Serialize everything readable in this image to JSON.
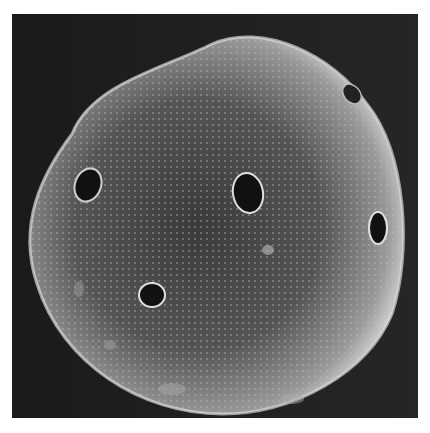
{
  "image": {
    "subject": "scanning electron micrograph of a spherical pollen grain with multiple circular pores",
    "background_color": "#1c1c1c",
    "border_color": "#ffffff",
    "grain_fill": "#8a8a8a",
    "pore_color": "#111111"
  },
  "pores": [
    {
      "cx": 76,
      "cy": 171,
      "rx": 13,
      "ry": 17,
      "rot": 20
    },
    {
      "cx": 236,
      "cy": 179,
      "rx": 15,
      "ry": 20,
      "rot": -10
    },
    {
      "cx": 366,
      "cy": 214,
      "rx": 9,
      "ry": 16,
      "rot": 0
    },
    {
      "cx": 140,
      "cy": 281,
      "rx": 13,
      "ry": 12,
      "rot": 0
    },
    {
      "cx": 340,
      "cy": 80,
      "rx": 8,
      "ry": 11,
      "rot": -40
    }
  ]
}
